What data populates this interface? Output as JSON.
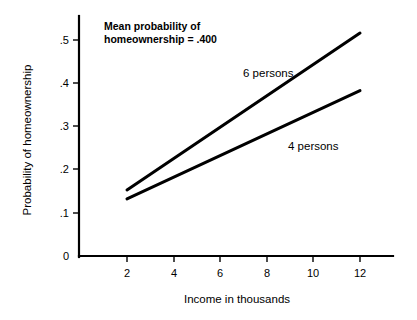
{
  "chart_data": {
    "type": "line",
    "title": "",
    "xlabel": "Income in thousands",
    "ylabel": "Probability of homeownership",
    "xlim": [
      0,
      13.5
    ],
    "ylim": [
      0,
      0.555
    ],
    "grid": false,
    "legend_position": "inline-labels",
    "x_ticks": [
      2,
      4,
      6,
      8,
      10,
      12
    ],
    "x_tick_labels": [
      "2",
      "4",
      "6",
      "8",
      "10",
      "12"
    ],
    "y_ticks": [
      0,
      0.1,
      0.2,
      0.3,
      0.4,
      0.5
    ],
    "y_tick_labels": [
      "0",
      ".1",
      ".2",
      ".3",
      ".4",
      ".5"
    ],
    "x": [
      2,
      12
    ],
    "series": [
      {
        "name": "6 persons",
        "label": "6 persons",
        "values": [
          0.153,
          0.516
        ]
      },
      {
        "name": "4 persons",
        "label": "4 persons",
        "values": [
          0.132,
          0.383
        ]
      }
    ],
    "annotations": [
      {
        "name": "mean-probability-note",
        "line1": "Mean probability of",
        "line2": "homeownership = .400",
        "value": 0.4
      }
    ]
  },
  "axis": {
    "y_title": "Probability of homeownership",
    "x_title": "Income in thousands",
    "y_tick_0": "0",
    "y_tick_1": ".1",
    "y_tick_2": ".2",
    "y_tick_3": ".3",
    "y_tick_4": ".4",
    "y_tick_5": ".5",
    "x_tick_0": "2",
    "x_tick_1": "4",
    "x_tick_2": "6",
    "x_tick_3": "8",
    "x_tick_4": "10",
    "x_tick_5": "12"
  },
  "labels": {
    "series_6": "6 persons",
    "series_4": "4 persons",
    "note_line1": "Mean probability of",
    "note_line2": "homeownership = .400"
  },
  "colors": {
    "background": "#ffffff",
    "ink": "#000000",
    "series": "#000000"
  }
}
